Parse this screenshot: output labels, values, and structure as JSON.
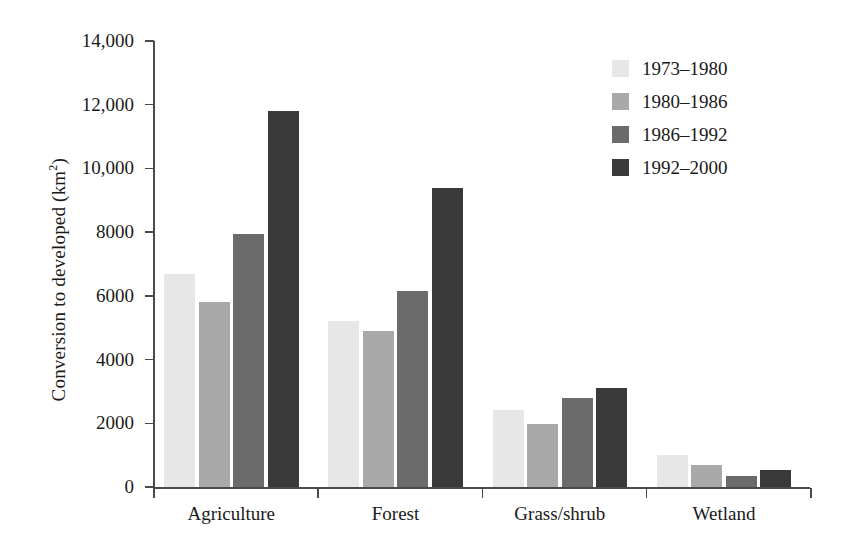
{
  "chart_data": {
    "type": "bar",
    "title": "",
    "subtitle": "",
    "xlabel": "",
    "ylabel": "Conversion to developed (km2)",
    "ylabel_base": "Conversion to developed (km",
    "ylabel_sup": "2",
    "ylabel_tail": ")",
    "categories": [
      "Agriculture",
      "Forest",
      "Grass/shrub",
      "Wetland"
    ],
    "series": [
      {
        "name": "1973–1980",
        "color": "#e7e7e7",
        "values": [
          6700,
          5200,
          2420,
          1000
        ]
      },
      {
        "name": "1980–1986",
        "color": "#a9a9a9",
        "values": [
          5800,
          4900,
          1980,
          680
        ]
      },
      {
        "name": "1986–1992",
        "color": "#6b6b6b",
        "values": [
          7950,
          6150,
          2800,
          350
        ]
      },
      {
        "name": "1992–2000",
        "color": "#3a3a3a",
        "values": [
          11800,
          9400,
          3100,
          530
        ]
      }
    ],
    "ylim": [
      0,
      14000
    ],
    "yticks": [
      0,
      2000,
      4000,
      6000,
      8000,
      10000,
      12000,
      14000
    ],
    "ytick_labels": [
      "0",
      "2000",
      "4000",
      "6000",
      "8000",
      "10,000",
      "12,000",
      "14,000"
    ],
    "grid": false,
    "legend_position": "top-right",
    "axis_color": "#4a4a4a"
  }
}
